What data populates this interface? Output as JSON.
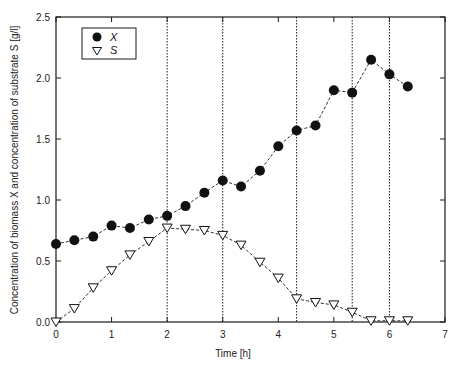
{
  "chart_data": {
    "type": "line",
    "title": "",
    "xlabel": "Time [h]",
    "ylabel": "Concentration of biomass X and concentration of substrate S [g/l]",
    "xlim": [
      0,
      7
    ],
    "ylim": [
      0,
      2.5
    ],
    "x_ticks": [
      "0",
      "1",
      "2",
      "3",
      "4",
      "5",
      "6",
      "7"
    ],
    "y_ticks": [
      "0.0",
      "0.5",
      "1.0",
      "1.5",
      "2.0",
      "2.5"
    ],
    "grid": false,
    "legend_position": "upper-left",
    "vertical_reference_lines": [
      2.0,
      3.0,
      4.33,
      5.33,
      6.0
    ],
    "series": [
      {
        "name": "X",
        "marker": "filled-circle",
        "line": "dashed",
        "x": [
          0,
          0.33,
          0.67,
          1.0,
          1.33,
          1.67,
          2.0,
          2.33,
          2.67,
          3.0,
          3.33,
          3.67,
          4.0,
          4.33,
          4.67,
          5.0,
          5.33,
          5.67,
          6.0,
          6.33
        ],
        "values": [
          0.64,
          0.67,
          0.7,
          0.79,
          0.77,
          0.84,
          0.87,
          0.95,
          1.06,
          1.16,
          1.11,
          1.24,
          1.44,
          1.57,
          1.61,
          1.9,
          1.88,
          2.15,
          2.03,
          1.93
        ]
      },
      {
        "name": "S",
        "marker": "open-triangle-down",
        "line": "dashed",
        "x": [
          0,
          0.33,
          0.67,
          1.0,
          1.33,
          1.67,
          2.0,
          2.33,
          2.67,
          3.0,
          3.33,
          3.67,
          4.0,
          4.33,
          4.67,
          5.0,
          5.33,
          5.67,
          6.0,
          6.33
        ],
        "values": [
          0.0,
          0.11,
          0.28,
          0.42,
          0.55,
          0.66,
          0.77,
          0.76,
          0.75,
          0.71,
          0.63,
          0.49,
          0.36,
          0.19,
          0.16,
          0.14,
          0.08,
          0.01,
          0.01,
          0.01
        ]
      }
    ]
  },
  "legend": {
    "items": [
      {
        "label": "X",
        "symbol": "filled-circle"
      },
      {
        "label": "S",
        "symbol": "open-triangle-down"
      }
    ]
  },
  "axes": {
    "x_title": "Time [h]",
    "y_title": "Concentration of biomass X and concentration of substrate S [g/l]"
  },
  "colors": {
    "ink": "#1a1a1a",
    "background": "#ffffff"
  }
}
